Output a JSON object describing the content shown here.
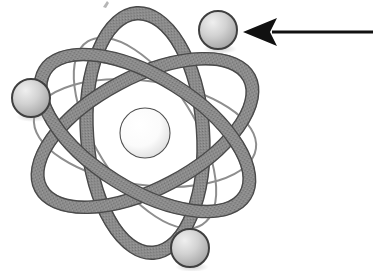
{
  "figure": {
    "alt_text": "Schematic atom with a central nucleus, three overlapping elliptical electron orbits, and three electron spheres; a black arrow points to the upper-right electron.",
    "background_color": "#ffffff",
    "width": 374,
    "height": 271
  },
  "palette": {
    "background": "#ffffff",
    "orbit_band_fill": "#898989",
    "orbit_band_stroke": "#4a4a4a",
    "thin_orbit_stroke": "#8e8e8e",
    "nucleus_fill_light": "#fdfdfd",
    "nucleus_fill_shade": "#dcdcdc",
    "nucleus_stroke": "#4f4f4f",
    "electron_fill_light": "#e8e8e8",
    "electron_fill_shade": "#a8a8a8",
    "electron_stroke": "#3f3f3f",
    "arrow_color": "#111111",
    "shadow_color": "#b9b9b9"
  },
  "nucleus": {
    "label": "nucleus",
    "cx": 145,
    "cy": 133,
    "r": 25
  },
  "orbits": [
    {
      "label": "orbit-band-1",
      "style": "thick",
      "cx": 145,
      "cy": 133,
      "rx": 118,
      "ry": 56,
      "rotation_deg": -28,
      "band_width": 13
    },
    {
      "label": "orbit-band-2",
      "style": "thick",
      "cx": 145,
      "cy": 133,
      "rx": 118,
      "ry": 56,
      "rotation_deg": 32,
      "band_width": 13
    },
    {
      "label": "orbit-band-3",
      "style": "thick",
      "cx": 145,
      "cy": 133,
      "rx": 120,
      "ry": 58,
      "rotation_deg": 86,
      "band_width": 13
    },
    {
      "label": "orbit-thin-1",
      "style": "thin",
      "cx": 145,
      "cy": 133,
      "rx": 112,
      "ry": 52,
      "rotation_deg": 8,
      "band_width": 2
    },
    {
      "label": "orbit-thin-2",
      "style": "thin",
      "cx": 145,
      "cy": 133,
      "rx": 108,
      "ry": 50,
      "rotation_deg": 58,
      "band_width": 2
    }
  ],
  "electrons": [
    {
      "label": "electron-top-right",
      "position": "top-right",
      "cx": 218,
      "cy": 30,
      "r": 19
    },
    {
      "label": "electron-left",
      "position": "left",
      "cx": 31,
      "cy": 98,
      "r": 19
    },
    {
      "label": "electron-bottom",
      "position": "bottom",
      "cx": 190,
      "cy": 248,
      "r": 19
    }
  ],
  "annotation": {
    "label": "pointer-arrow",
    "description": "Black arrow pointing left toward the upper-right electron",
    "points_to": "electron-top-right",
    "tail_x": 373,
    "tip_x": 243,
    "y": 32,
    "shaft_thickness": 3,
    "head_length": 32,
    "head_half_height": 14,
    "caption": ""
  },
  "artifact": {
    "label": "scan-mark",
    "description": "faint scanner mark near top edge",
    "x": 106,
    "y": 4
  }
}
